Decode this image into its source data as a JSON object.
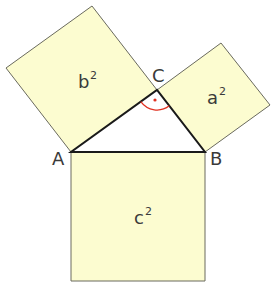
{
  "diagram": {
    "vertices": [
      {
        "id": "A",
        "label": "A"
      },
      {
        "id": "B",
        "label": "B"
      },
      {
        "id": "C",
        "label": "C"
      }
    ],
    "squares": [
      {
        "id": "a2",
        "base": "a",
        "exponent": "2",
        "side": "BC"
      },
      {
        "id": "b2",
        "base": "b",
        "exponent": "2",
        "side": "AC"
      },
      {
        "id": "c2",
        "base": "c",
        "exponent": "2",
        "side": "AB"
      }
    ],
    "right_angle_at": "C",
    "colors": {
      "square_fill": "#fcfcd0",
      "triangle_stroke": "#1a1a1a",
      "right_angle_mark": "#e03020"
    }
  }
}
